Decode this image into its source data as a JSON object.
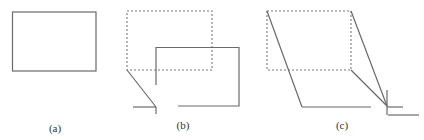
{
  "figure": {
    "panels": [
      {
        "id": "a",
        "label": "(a)"
      },
      {
        "id": "b",
        "label": "(b)"
      },
      {
        "id": "c",
        "label": "(c)"
      }
    ],
    "colors": {
      "stroke": "#6a6a6a",
      "dashed_stroke": "#7a7a7a",
      "background": "#ffffff",
      "label": "#333333"
    }
  }
}
